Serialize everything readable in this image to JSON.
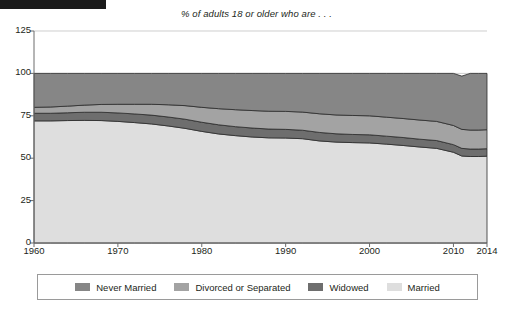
{
  "redaction": {
    "name": "redaction-bar",
    "color": "#1b1b1b"
  },
  "chart_data": {
    "type": "area",
    "stacked": true,
    "title": "% of adults 18 or older who are . . .",
    "xlabel": "",
    "ylabel": "",
    "xlim": [
      1960,
      2014
    ],
    "ylim": [
      0,
      125
    ],
    "ytick_labels": [
      "0",
      "25",
      "50",
      "75",
      "100",
      "125"
    ],
    "yticks": [
      0,
      25,
      50,
      75,
      100,
      125
    ],
    "xtick_labels": [
      "1960",
      "1970",
      "1980",
      "1990",
      "2000",
      "2010",
      "2014"
    ],
    "xticks": [
      1960,
      1970,
      1980,
      1990,
      2000,
      2010,
      2014
    ],
    "grid": "horizontal",
    "legend_position": "bottom",
    "x": [
      1960,
      1962,
      1964,
      1966,
      1968,
      1970,
      1972,
      1974,
      1976,
      1978,
      1980,
      1982,
      1984,
      1986,
      1988,
      1990,
      1992,
      1994,
      1996,
      1998,
      2000,
      2002,
      2004,
      2006,
      2008,
      2010,
      2011,
      2012,
      2013,
      2014
    ],
    "stack_order_bottom_to_top": [
      "Married",
      "Widowed",
      "Divorced or Separated",
      "Never Married"
    ],
    "series": [
      {
        "name": "Married",
        "color": "#dedede",
        "values": [
          72.0,
          72.0,
          72.2,
          72.3,
          72.2,
          71.7,
          71.0,
          70.2,
          69.0,
          67.6,
          65.8,
          64.3,
          63.3,
          62.5,
          62.0,
          61.9,
          61.5,
          60.2,
          59.5,
          59.2,
          59.0,
          58.3,
          57.5,
          56.6,
          55.8,
          53.5,
          51.3,
          51.0,
          51.0,
          51.2
        ]
      },
      {
        "name": "Widowed",
        "color": "#6e6e6e",
        "values": [
          4.5,
          4.5,
          4.6,
          4.8,
          4.9,
          5.0,
          5.1,
          5.2,
          5.3,
          5.4,
          5.4,
          5.4,
          5.3,
          5.3,
          5.2,
          5.1,
          5.0,
          5.0,
          4.9,
          4.8,
          4.8,
          4.7,
          4.7,
          4.6,
          4.6,
          4.5,
          4.5,
          4.4,
          4.4,
          4.4
        ]
      },
      {
        "name": "Divorced or Separated",
        "color": "#a3a3a3",
        "values": [
          3.5,
          3.7,
          3.9,
          4.2,
          4.6,
          5.1,
          5.7,
          6.4,
          7.2,
          8.0,
          8.8,
          9.5,
          10.0,
          10.3,
          10.5,
          10.6,
          10.7,
          11.0,
          11.1,
          11.2,
          11.2,
          11.2,
          11.2,
          11.3,
          11.3,
          11.3,
          11.2,
          11.2,
          11.2,
          11.2
        ]
      },
      {
        "name": "Never Married",
        "color": "#868686",
        "values": [
          20.0,
          19.8,
          19.3,
          18.7,
          18.3,
          18.2,
          18.2,
          18.2,
          18.5,
          19.0,
          20.0,
          20.8,
          21.4,
          21.9,
          22.3,
          22.4,
          22.8,
          23.8,
          24.5,
          24.8,
          25.0,
          25.8,
          26.6,
          27.5,
          28.3,
          30.7,
          31.4,
          33.4,
          33.4,
          33.2
        ]
      }
    ],
    "legend": [
      {
        "label": "Never Married",
        "color": "#868686"
      },
      {
        "label": "Divorced or Separated",
        "color": "#a3a3a3"
      },
      {
        "label": "Widowed",
        "color": "#6e6e6e"
      },
      {
        "label": "Married",
        "color": "#dedede"
      }
    ]
  }
}
